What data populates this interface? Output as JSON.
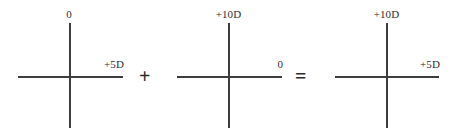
{
  "diagram": {
    "type": "optical-power-cross-equation",
    "line_color": "#3d3d3d",
    "text_color": "#2f2f2f",
    "background_color": "#ffffff",
    "crosses": [
      {
        "name": "cross-1",
        "vertical_meridian_label": "0",
        "horizontal_meridian_label": "+5D"
      },
      {
        "name": "cross-2",
        "vertical_meridian_label": "+10D",
        "horizontal_meridian_label": "0"
      },
      {
        "name": "cross-3",
        "vertical_meridian_label": "+10D",
        "horizontal_meridian_label": "+5D"
      }
    ],
    "operators": {
      "plus": "+",
      "equals": "="
    }
  }
}
